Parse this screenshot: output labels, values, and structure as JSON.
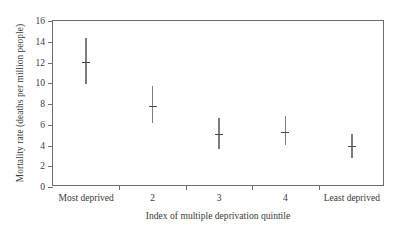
{
  "chart_data": {
    "type": "scatter",
    "title": "",
    "xlabel": "Index of multiple deprivation quintile",
    "ylabel": "Mortality rate (deaths per million people)",
    "categories": [
      "Most deprived",
      "2",
      "3",
      "4",
      "Least deprived"
    ],
    "values": [
      12.0,
      7.85,
      5.1,
      5.3,
      3.95
    ],
    "errors_low": [
      9.9,
      6.2,
      3.7,
      4.0,
      2.8
    ],
    "errors_high": [
      14.4,
      9.7,
      6.65,
      6.85,
      5.1
    ],
    "ylim": [
      0,
      16
    ],
    "ytick_labels": [
      "0",
      "2",
      "4",
      "6",
      "8",
      "10",
      "12",
      "14",
      "16"
    ],
    "ytick_values": [
      0,
      2,
      4,
      6,
      8,
      10,
      12,
      14,
      16
    ],
    "grid": false,
    "legend": "none",
    "marker_color": "#7d7d7d",
    "axis_color": "#6e6e6e"
  }
}
